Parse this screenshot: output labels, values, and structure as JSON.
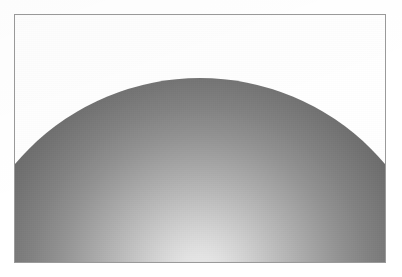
{
  "figure": {
    "caption": "",
    "background_color": "#ffffff",
    "frame": {
      "border_color": "#9a9a9a",
      "border_width_px": 1,
      "x": 14,
      "y": 14,
      "width": 372,
      "height": 249
    }
  },
  "chart_data": {
    "type": "scatter",
    "subtitle": "",
    "xlabel": "",
    "ylabel": "",
    "grid": false,
    "legend": "none",
    "tick_labels_x": [],
    "tick_labels_y": [],
    "annotations": [],
    "render": {
      "object": "sphere",
      "projection": "orthographic",
      "apex_y_px": 78,
      "center_x_px": 200,
      "center_y_px": 320,
      "radius_px": 242,
      "clipped_by_frame": true,
      "arc_exits_left_border_at_y_px": 168,
      "arc_exits_right_border_at_y_px": 196,
      "shading_model": "diffuse-radial",
      "light_position": "bottom-center",
      "highlight_x_pct": 50,
      "highlight_y_pct": 41
    },
    "shading_stops": [
      {
        "stop_pct": 0,
        "color": "#ececec"
      },
      {
        "stop_pct": 6,
        "color": "#e3e3e3"
      },
      {
        "stop_pct": 13,
        "color": "#d2d2d2"
      },
      {
        "stop_pct": 21,
        "color": "#bdbdbd"
      },
      {
        "stop_pct": 29,
        "color": "#a8a8a8"
      },
      {
        "stop_pct": 37,
        "color": "#949494"
      },
      {
        "stop_pct": 45,
        "color": "#828282"
      },
      {
        "stop_pct": 54,
        "color": "#727272"
      },
      {
        "stop_pct": 63,
        "color": "#646464"
      },
      {
        "stop_pct": 72,
        "color": "#565656"
      },
      {
        "stop_pct": 81,
        "color": "#4a4a4a"
      },
      {
        "stop_pct": 90,
        "color": "#3f3f3f"
      },
      {
        "stop_pct": 96,
        "color": "#363636"
      },
      {
        "stop_pct": 100,
        "color": "#313131"
      }
    ],
    "sampled_colors": {
      "apex_top": "#3a3a3a",
      "bottom_center": "#e8e8e8",
      "bottom_left": "#999999",
      "bottom_right": "#9a9a9a",
      "mid_left": "#747474",
      "mid_right": "#6e6e6e",
      "outside_shape": "#ffffff",
      "frame_border": "#9a9a9a"
    }
  }
}
